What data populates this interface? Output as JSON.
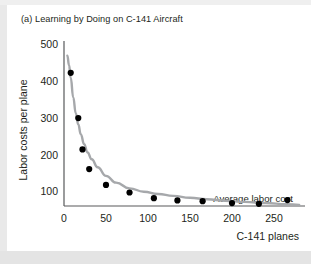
{
  "figure": {
    "title": "(a) Learning by Doing on C-141 Aircraft",
    "background_color": "#ffffff",
    "ink_color": "#231f20",
    "axis_color": "#58595b"
  },
  "chart_data": {
    "type": "line",
    "title": "(a) Learning by Doing on C-141 Aircraft",
    "xlabel": "C-141 planes",
    "ylabel": "Labor costs per plane",
    "xlim": [
      0,
      285
    ],
    "ylim": [
      0,
      520
    ],
    "xticks": [
      0,
      50,
      100,
      150,
      200,
      250
    ],
    "xtick_labels": [
      "0",
      "50",
      "100",
      "150",
      "200",
      "250"
    ],
    "yticks": [
      100,
      200,
      300,
      400,
      500
    ],
    "ytick_labels": [
      "100",
      "200",
      "300",
      "400",
      "500"
    ],
    "grid": false,
    "legend_position": "inline-annotation",
    "series": [
      {
        "name": "Average labor cost",
        "annotation": "Average labor cost",
        "marker": "filled-circle",
        "marker_color": "#000000",
        "line_color": "#a6a8ab",
        "x": [
          8,
          17,
          22,
          30,
          50,
          78,
          107,
          135,
          165,
          200,
          232,
          266
        ],
        "y": [
          425,
          305,
          222,
          170,
          128,
          108,
          93,
          87,
          85,
          80,
          78,
          88
        ]
      }
    ],
    "fitted_curve": {
      "description": "smooth declining average labor cost curve",
      "x": [
        4,
        6,
        8,
        11,
        14,
        17,
        20,
        24,
        28,
        33,
        40,
        50,
        62,
        78,
        95,
        112,
        130,
        150,
        170,
        192,
        215,
        240,
        265,
        280
      ],
      "y": [
        470,
        445,
        412,
        360,
        318,
        288,
        262,
        236,
        214,
        196,
        175,
        152,
        134,
        119,
        110,
        104,
        99,
        94,
        90,
        86,
        83,
        80,
        77,
        75
      ]
    }
  },
  "axes": {
    "y_axis_title": "Labor costs per plane",
    "x_axis_title": "C-141 planes",
    "annotation_label": "Average labor cost"
  }
}
